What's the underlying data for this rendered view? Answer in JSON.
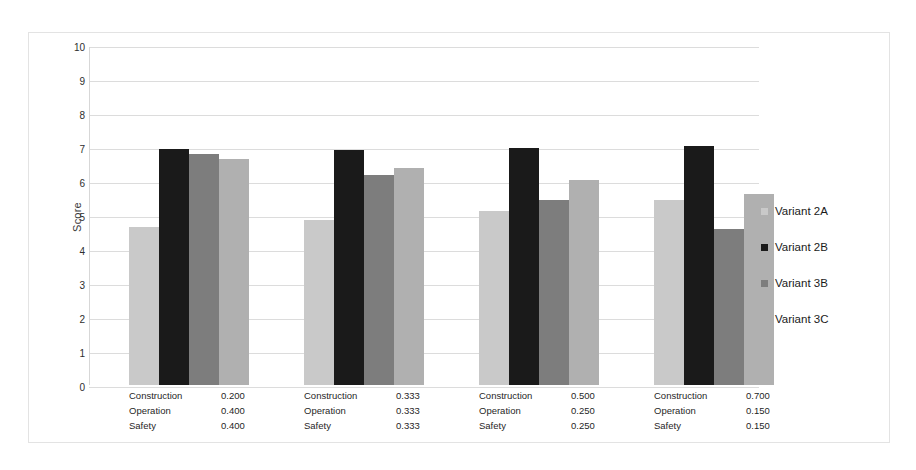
{
  "chart_data": {
    "type": "bar",
    "title": "",
    "xlabel": "",
    "ylabel": "Score",
    "ylim": [
      0,
      10
    ],
    "ytick_step": 1,
    "yticks": [
      "10",
      "9",
      "8",
      "7",
      "6",
      "5",
      "4",
      "3",
      "2",
      "1",
      "0"
    ],
    "grid": true,
    "legend_position": "right",
    "categories": [
      "Construction 0.200 / Operation 0.400 / Safety 0.400",
      "Construction 0.333 / Operation 0.333 / Safety 0.333",
      "Construction 0.500 / Operation 0.250 / Safety 0.250",
      "Construction 0.700 / Operation 0.150 / Safety 0.150"
    ],
    "category_blocks": [
      {
        "rows": [
          {
            "criterion": "Construction",
            "weight": "0.200"
          },
          {
            "criterion": "Operation",
            "weight": "0.400"
          },
          {
            "criterion": "Safety",
            "weight": "0.400"
          }
        ]
      },
      {
        "rows": [
          {
            "criterion": "Construction",
            "weight": "0.333"
          },
          {
            "criterion": "Operation",
            "weight": "0.333"
          },
          {
            "criterion": "Safety",
            "weight": "0.333"
          }
        ]
      },
      {
        "rows": [
          {
            "criterion": "Construction",
            "weight": "0.500"
          },
          {
            "criterion": "Operation",
            "weight": "0.250"
          },
          {
            "criterion": "Safety",
            "weight": "0.250"
          }
        ]
      },
      {
        "rows": [
          {
            "criterion": "Construction",
            "weight": "0.700"
          },
          {
            "criterion": "Operation",
            "weight": "0.150"
          },
          {
            "criterion": "Safety",
            "weight": "0.150"
          }
        ]
      }
    ],
    "series": [
      {
        "name": "Variant 2A",
        "color": "#c9c9c9",
        "values": [
          4.65,
          4.85,
          5.12,
          5.45
        ]
      },
      {
        "name": "Variant 2B",
        "color": "#1a1a1a",
        "values": [
          6.93,
          6.92,
          6.97,
          7.03
        ]
      },
      {
        "name": "Variant 3B",
        "color": "#7d7d7d",
        "values": [
          6.78,
          6.17,
          5.45,
          4.58
        ]
      },
      {
        "name": "Variant 3C",
        "color": "#b0b0b0",
        "values": [
          6.65,
          6.38,
          6.02,
          5.62
        ]
      }
    ]
  }
}
